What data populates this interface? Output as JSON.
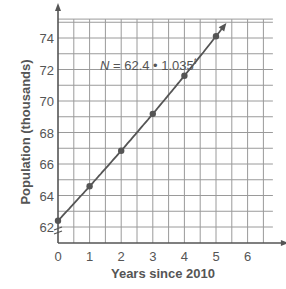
{
  "chart_data": {
    "type": "line",
    "title": "",
    "xlabel": "Years since 2010",
    "ylabel": "Population (thousands)",
    "annotation": "N = 62.4 • 1.035^t",
    "equation": {
      "lhs": "N",
      "base_coef": "62.4",
      "growth": "1.035",
      "exponent": "t"
    },
    "x_ticks": [
      0,
      1,
      2,
      3,
      4,
      5,
      6
    ],
    "y_ticks": [
      62,
      64,
      66,
      68,
      70,
      72,
      74
    ],
    "xlim": [
      0,
      6.8
    ],
    "ylim": [
      61.2,
      75.2
    ],
    "y_axis_break": true,
    "grid": true,
    "grid_x_step": 0.5,
    "grid_y_step": 1,
    "series": [
      {
        "name": "N = 62.4 • 1.035^t",
        "x": [
          0,
          1,
          2,
          3,
          4,
          5
        ],
        "y": [
          62.4,
          64.6,
          66.8,
          69.2,
          71.6,
          74.1
        ],
        "markers": true,
        "arrow_end": true
      }
    ],
    "colors": {
      "line": "#555555",
      "grid": "#9a9a9a",
      "text": "#555555"
    }
  }
}
